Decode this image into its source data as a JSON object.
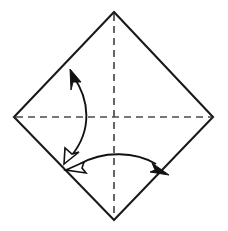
{
  "figure": {
    "canvas": {
      "width": 228,
      "height": 231,
      "background": "#ffffff"
    }
  },
  "colors": {
    "paper_edge": "#1a1a1a",
    "crease": "#4a4a4a",
    "arrow": "#111111",
    "arrowhead_fill_solid": "#111111",
    "arrowhead_fill_hollow": "#ffffff",
    "background": "#ffffff"
  },
  "paper": {
    "name": "square-sheet-diamond",
    "shape": "diamond",
    "vertices": {
      "top": {
        "x": 114,
        "y": 12
      },
      "right": {
        "x": 213,
        "y": 117
      },
      "bottom": {
        "x": 114,
        "y": 220
      },
      "left": {
        "x": 14,
        "y": 117
      }
    },
    "points": "114,12 213,117 114,220 14,117",
    "stroke_width": 2.1
  },
  "creases": [
    {
      "name": "vertical-crease",
      "type": "dashed",
      "orientation": "vertical",
      "from": {
        "x": 114,
        "y": 14
      },
      "to": {
        "x": 114,
        "y": 218
      },
      "dash": "7 5"
    },
    {
      "name": "horizontal-crease",
      "type": "dashed",
      "orientation": "horizontal",
      "from": {
        "x": 16,
        "y": 117
      },
      "to": {
        "x": 211,
        "y": 117
      },
      "dash": "7 5"
    }
  ],
  "arrows": [
    {
      "name": "left-fold-arrow",
      "orientation": "vertical-arc",
      "curve_path": "M 73 76 C 90 100, 92 130, 72 155",
      "bulge": "right",
      "heads": [
        {
          "name": "arrowhead-solid-up",
          "style": "solid",
          "points": "70,69 81,82 73,82 71,90",
          "direction": "up-left",
          "tip": {
            "x": 70,
            "y": 69
          }
        },
        {
          "name": "arrowhead-hollow-down",
          "style": "hollow",
          "points": "64,164 65,148 72,154 79,152",
          "direction": "down-left",
          "tip": {
            "x": 64,
            "y": 164
          }
        }
      ]
    },
    {
      "name": "bottom-fold-arrow",
      "orientation": "horizontal-arc",
      "curve_path": "M 80 164 C 104 150, 136 152, 156 164",
      "bulge": "up",
      "heads": [
        {
          "name": "arrowhead-hollow-left",
          "style": "hollow",
          "points": "66,170 84,162 82,168 86,173",
          "direction": "left",
          "tip": {
            "x": 66,
            "y": 170
          }
        },
        {
          "name": "arrowhead-solid-right",
          "style": "solid",
          "points": "169,175 152,163 155,170 150,172",
          "direction": "down-right",
          "tip": {
            "x": 169,
            "y": 175
          }
        }
      ]
    }
  ]
}
